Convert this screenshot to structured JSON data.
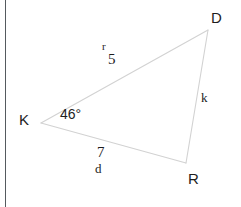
{
  "figure": {
    "kind": "triangle-diagram",
    "background_color": "#ffffff",
    "stroke_color": "#d2d2d2",
    "text_color": "#1d1d1d",
    "rule_color": "#555a5e",
    "vertices": [
      {
        "id": "D",
        "label": "D",
        "x": 208,
        "y": 30
      },
      {
        "id": "K",
        "label": "K",
        "x": 41,
        "y": 123
      },
      {
        "id": "R",
        "label": "R",
        "x": 186,
        "y": 163
      }
    ],
    "sides": [
      {
        "id": "KD",
        "name": "r",
        "length": "5",
        "from": "K",
        "to": "D"
      },
      {
        "id": "DR",
        "name": "k",
        "length": "",
        "from": "D",
        "to": "R"
      },
      {
        "id": "KR",
        "name": "d",
        "length": "7",
        "from": "K",
        "to": "R"
      }
    ],
    "angles": [
      {
        "at": "K",
        "measure": "46°"
      }
    ]
  },
  "labels": {
    "vertex_d": "D",
    "vertex_k": "K",
    "vertex_r": "R",
    "side_r_name": "r",
    "side_r_length": "5",
    "side_k_name": "k",
    "side_d_name": "d",
    "side_d_length": "7",
    "angle_k": "46°"
  }
}
